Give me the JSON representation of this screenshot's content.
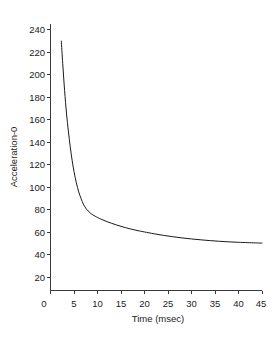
{
  "chart_data": {
    "type": "line",
    "title": "",
    "xlabel": "Time (msec)",
    "ylabel": "Acceleration-0",
    "xlim": [
      0,
      45
    ],
    "ylim": [
      0,
      248
    ],
    "grid": false,
    "legend": null,
    "xticks": [
      0,
      5,
      10,
      15,
      20,
      25,
      30,
      35,
      40,
      45
    ],
    "xtick_labels": [
      "0",
      "5",
      "10",
      "15",
      "20",
      "25",
      "30",
      "35",
      "40",
      "45"
    ],
    "yticks": [
      20,
      40,
      60,
      80,
      100,
      120,
      140,
      160,
      180,
      200,
      220,
      240
    ],
    "ytick_labels": [
      "20",
      "40",
      "60",
      "80",
      "100",
      "120",
      "140",
      "160",
      "180",
      "200",
      "220",
      "240"
    ],
    "series": [
      {
        "name": "Acceleration-0",
        "color": "#1a1a1a",
        "x": [
          2.3,
          2.6,
          3.0,
          3.4,
          3.8,
          4.2,
          4.6,
          5.0,
          5.5,
          6.0,
          6.5,
          7.0,
          7.5,
          8.0,
          8.5,
          9.0,
          9.5,
          10.0,
          11.0,
          12.0,
          13.0,
          14.0,
          15.0,
          16.0,
          17.0,
          18.0,
          19.0,
          20.0,
          22.0,
          24.0,
          26.0,
          28.0,
          30.0,
          32.0,
          34.0,
          36.0,
          38.0,
          40.0,
          42.0,
          45.0
        ],
        "y": [
          230,
          210,
          186,
          166,
          150,
          136,
          124,
          114,
          104,
          96,
          90,
          85,
          81.5,
          79,
          77,
          75.5,
          74.3,
          73.2,
          71.2,
          69.5,
          68.0,
          66.6,
          65.3,
          64.1,
          63.0,
          62.0,
          61.1,
          60.3,
          58.7,
          57.3,
          56.1,
          55.0,
          54.1,
          53.3,
          52.6,
          52.0,
          51.5,
          51.1,
          50.8,
          50.4
        ]
      }
    ]
  },
  "axes": {
    "x_axis_label": "Time (msec)",
    "y_axis_label": "Acceleration-0"
  }
}
